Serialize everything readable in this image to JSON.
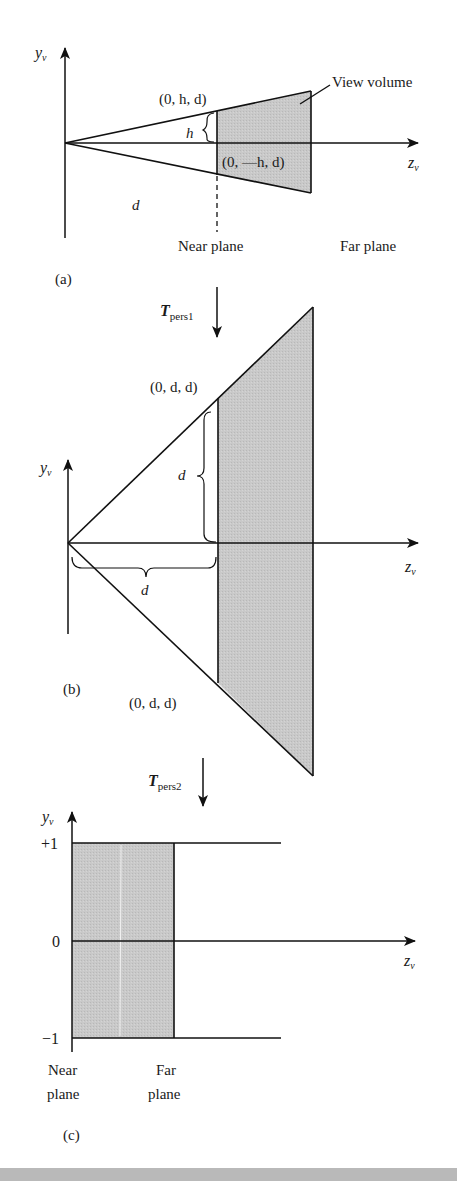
{
  "figure": {
    "panels": [
      {
        "id": "a",
        "caption": "(a)",
        "axis_y": "y",
        "axis_y_sub": "v",
        "axis_z": "z",
        "axis_z_sub": "v",
        "labels": {
          "top_point": "(0, h, d)",
          "bottom_point": "(0, —h, d)",
          "h": "h",
          "d": "d",
          "view_volume": "View volume",
          "near_plane": "Near plane",
          "far_plane": "Far plane"
        }
      },
      {
        "id": "b",
        "caption": "(b)",
        "transform": "T",
        "transform_sub": "pers1",
        "axis_y": "y",
        "axis_y_sub": "v",
        "axis_z": "z",
        "axis_z_sub": "v",
        "labels": {
          "top_point": "(0, d, d)",
          "bottom_point": "(0,  d, d)",
          "d_vertical": "d",
          "d_horizontal": "d"
        }
      },
      {
        "id": "c",
        "caption": "(c)",
        "transform": "T",
        "transform_sub": "pers2",
        "axis_y": "y",
        "axis_y_sub": "v",
        "axis_z": "z",
        "axis_z_sub": "v",
        "ticks": {
          "plus_one": "+1",
          "zero": "0",
          "minus_one": "−1"
        },
        "labels": {
          "near_line1": "Near",
          "near_line2": "plane",
          "far_line1": "Far",
          "far_line2": "plane"
        }
      }
    ],
    "colors": {
      "stroke": "#111111",
      "fill": "#c8c8c8",
      "footer": "#b9b9b9"
    }
  }
}
